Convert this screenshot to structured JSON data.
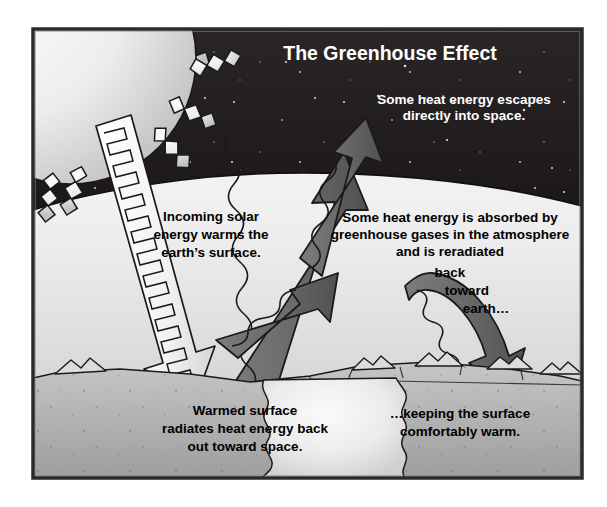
{
  "figure": {
    "title": "The Greenhouse Effect",
    "alt_name": "greenhouse-effect-diagram",
    "frame": {
      "border_color": "#1a1a1a",
      "background": "#ffffff"
    }
  },
  "palette": {
    "space": "#231f20",
    "space_dark": "#1b1718",
    "atmosphere_light": "#f4f4f4",
    "atmosphere_mid": "#d8d8d8",
    "ground_light": "#e9e9e9",
    "ground_mid": "#b4b4b4",
    "ground_dark": "#9a9a9a",
    "sun_light": "#f2f2f2",
    "sun_shadow": "#c9c9c9",
    "arrow_gray": "#6e6e6e",
    "arrow_gray_dark": "#565656",
    "arrow_white": "#f0f0f0",
    "outline": "#1a1a1a",
    "text_dark": "#000000",
    "text_light": "#ffffff"
  },
  "labels": {
    "title": "The Greenhouse Effect",
    "escape": {
      "lines": [
        "Some heat energy escapes",
        "directly into space."
      ],
      "color": "#ffffff"
    },
    "incoming": {
      "lines": [
        "Incoming solar",
        "energy warms the",
        "earth’s surface."
      ],
      "color": "#000000"
    },
    "absorbed": {
      "lines": [
        "Some heat energy is absorbed by",
        "greenhouse gases in the atmosphere",
        "and is reradiated",
        "back",
        "toward",
        "earth…"
      ],
      "color": "#000000"
    },
    "warmed": {
      "lines": [
        "Warmed surface",
        "radiates heat energy back",
        "out toward space."
      ],
      "color": "#000000"
    },
    "keeping": {
      "lines": [
        "…keeping the surface",
        "comfortably warm."
      ],
      "color": "#000000"
    }
  },
  "elements": {
    "sun": "sun-with-zigzag-rays",
    "space": "night-sky-with-stars",
    "atmosphere": "atmosphere-band",
    "ground": "earth-surface-with-mountains",
    "incoming_ray": "incoming-solar-ray-arrow",
    "escaping_ray": "escaping-heat-arrow",
    "absorbed_ray": "absorbed-heat-arrow",
    "reradiated_ray": "reradiated-heat-arrow"
  }
}
